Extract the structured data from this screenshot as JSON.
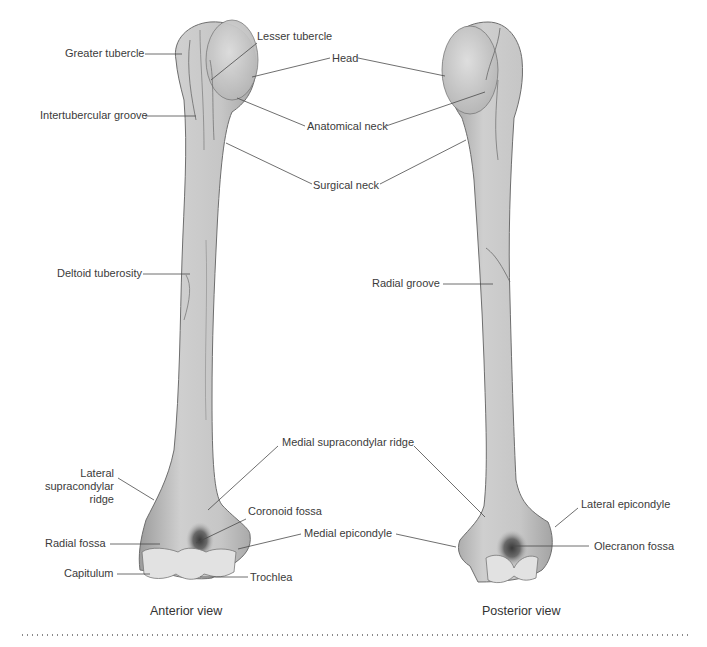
{
  "figure": {
    "views": [
      {
        "caption": "Anterior view",
        "labels": {
          "greater_tubercle": "Greater tubercle",
          "lesser_tubercle": "Lesser tubercle",
          "intertubercular_groove": "Intertubercular groove",
          "deltoid_tuberosity": "Deltoid tuberosity",
          "lateral_supracondylar_ridge_1": "Lateral",
          "lateral_supracondylar_ridge_2": "supracondylar",
          "lateral_supracondylar_ridge_3": "ridge",
          "radial_fossa": "Radial fossa",
          "capitulum": "Capitulum",
          "coronoid_fossa": "Coronoid fossa",
          "trochlea": "Trochlea"
        }
      },
      {
        "caption": "Posterior view",
        "labels": {
          "radial_groove": "Radial groove",
          "lateral_epicondyle": "Lateral epicondyle",
          "olecranon_fossa": "Olecranon fossa"
        }
      }
    ],
    "shared_labels": {
      "head": "Head",
      "anatomical_neck": "Anatomical neck",
      "surgical_neck": "Surgical neck",
      "medial_supracondylar_ridge": "Medial supracondylar ridge",
      "medial_epicondyle": "Medial epicondyle"
    },
    "colors": {
      "bone_fill": "#c9c9c9",
      "bone_shade": "#9a9a9a",
      "bone_light": "#e2e2e2",
      "leader_line": "#4a4a4a",
      "text": "#3b3b3b"
    }
  }
}
